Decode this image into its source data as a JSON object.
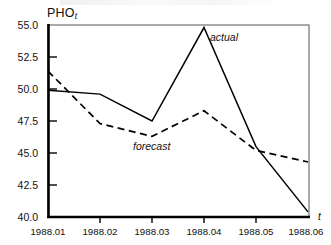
{
  "chart_data": {
    "type": "line",
    "title": "",
    "subtitle": "",
    "xlabel": "t",
    "ylabel": "PHO",
    "ylabel_subscript": "t",
    "x": [
      "1988.01",
      "1988.02",
      "1988.03",
      "1988.04",
      "1988.05",
      "1988.06"
    ],
    "categories": [
      "1988.01",
      "1988.02",
      "1988.03",
      "1988.04",
      "1988.05",
      "1988.06"
    ],
    "series": [
      {
        "name": "actual",
        "style": "solid",
        "color": "#000000",
        "values": [
          49.9,
          49.6,
          47.5,
          54.8,
          45.5,
          40.4
        ]
      },
      {
        "name": "forecast",
        "style": "dashed",
        "color": "#000000",
        "values": [
          51.4,
          47.3,
          46.3,
          48.3,
          45.2,
          44.3
        ]
      }
    ],
    "ylim": [
      40.0,
      55.0
    ],
    "yticks": [
      "55.0",
      "52.5",
      "50.0",
      "47.5",
      "45.0",
      "42.5",
      "40.0"
    ],
    "ytick_values": [
      55.0,
      52.5,
      50.0,
      47.5,
      45.0,
      42.5,
      40.0
    ],
    "xtick_labels": [
      "1988.01",
      "1988.02",
      "1988.03",
      "1988.04",
      "1988.05",
      "1988.06"
    ],
    "grid": false,
    "legend_position": "inline-annotations",
    "annotations": [
      {
        "text": "actual",
        "series": "actual"
      },
      {
        "text": "forecast",
        "series": "forecast"
      }
    ]
  },
  "axes": {
    "y_title": "PHO",
    "y_title_subscript": "t",
    "x_variable": "t"
  },
  "labels": {
    "actual": "actual",
    "forecast": "forecast"
  },
  "yticks": {
    "t0": "55.0",
    "t1": "52.5",
    "t2": "50.0",
    "t3": "47.5",
    "t4": "45.0",
    "t5": "42.5",
    "t6": "40.0"
  },
  "xticks": {
    "t0": "1988.01",
    "t1": "1988.02",
    "t2": "1988.03",
    "t3": "1988.04",
    "t4": "1988.05",
    "t5": "1988.06"
  }
}
